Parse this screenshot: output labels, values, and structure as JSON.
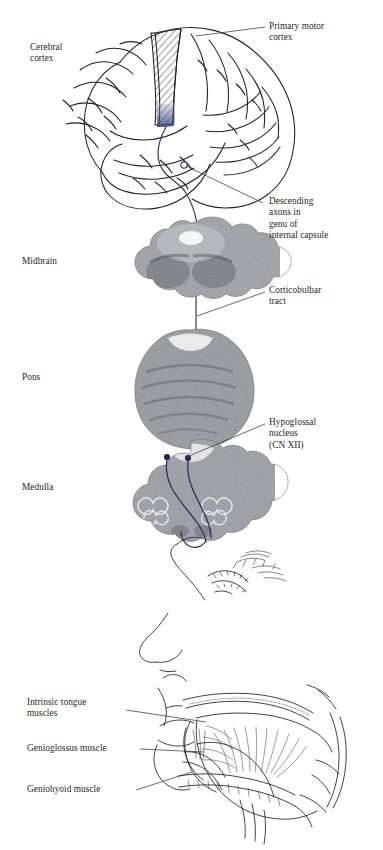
{
  "figure": {
    "background_color": "#ffffff",
    "ink_color": "#231f20",
    "tract_color": "#2f3f73",
    "tract_accent_color": "#1d2a57",
    "leader_color": "#3a3a3a"
  },
  "labels": {
    "cerebral_cortex": "Cerebral\ncortex",
    "primary_motor_cortex": "Primary motor\ncortex",
    "descending_axons": "Descending\naxons in\ngenu of\ninternal capsule",
    "midbrain": "Midbrain",
    "corticobulbar_tract": "Corticobulbar\ntract",
    "pons": "Pons",
    "hypoglossal_nucleus": "Hypoglossal\nnucleus\n(CN XII)",
    "medulla": "Medulla",
    "intrinsic_tongue_muscles": "Intrinsic tongue\nmuscles",
    "genioglossus_muscle": "Genioglossus muscle",
    "geniohyoid_muscle": "Geniohyoid muscle"
  },
  "panels": {
    "brain_lateral": "lateral-view-cerebral-hemisphere",
    "midbrain_section": "midbrain-cross-section",
    "pons_section": "pons-cross-section",
    "medulla_section": "medulla-cross-section",
    "head_sagittal": "sagittal-head-tongue-section"
  },
  "markers": {
    "internal_capsule_genu": "genu-marker-circle",
    "hypoglossal_nucleus_left": "nucleus-dot-left",
    "hypoglossal_nucleus_right": "nucleus-dot-right"
  }
}
